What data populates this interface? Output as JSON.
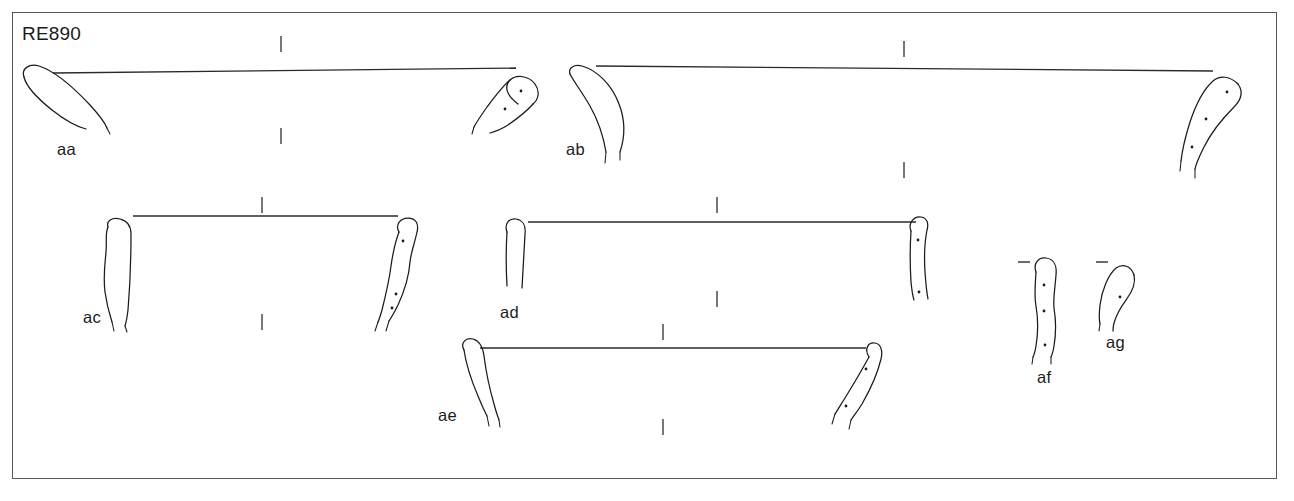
{
  "plate": {
    "title": "RE890",
    "background_color": "#ffffff",
    "frame_color": "#58585a",
    "ink_color": "#1b1b1b",
    "frame": {
      "x": 12,
      "y": 12,
      "width": 1265,
      "height": 467
    }
  },
  "fragments": [
    {
      "id": "aa",
      "label": "aa",
      "label_x": 57,
      "label_y": 140,
      "left_piece": {
        "x": 20,
        "y": 66,
        "dots": 0
      },
      "right_piece": {
        "x": 476,
        "y": 70,
        "dots": 2
      },
      "arc_line": {
        "x1": 53,
        "y1": 73,
        "x2": 516,
        "y2": 68
      },
      "ticks_above": [
        {
          "x": 281,
          "y": 42
        }
      ],
      "ticks_below": [
        {
          "x": 281,
          "y": 134
        }
      ]
    },
    {
      "id": "ab",
      "label": "ab",
      "label_x": 566,
      "label_y": 140,
      "left_piece": {
        "x": 566,
        "y": 64,
        "dots": 0
      },
      "right_piece": {
        "x": 1176,
        "y": 64,
        "dots": 3
      },
      "arc_line": {
        "x1": 596,
        "y1": 66,
        "x2": 1213,
        "y2": 71
      },
      "ticks_above": [
        {
          "x": 904,
          "y": 47
        }
      ],
      "ticks_below": [
        {
          "x": 904,
          "y": 168
        }
      ]
    },
    {
      "id": "ac",
      "label": "ac",
      "label_x": 83,
      "label_y": 308,
      "left_piece": {
        "x": 104,
        "y": 219,
        "dots": 0
      },
      "right_piece": {
        "x": 382,
        "y": 213,
        "dots": 3
      },
      "arc_line": {
        "x1": 133,
        "y1": 216,
        "x2": 398,
        "y2": 216
      },
      "ticks_above": [
        {
          "x": 262,
          "y": 203
        }
      ],
      "ticks_below": [
        {
          "x": 262,
          "y": 320
        }
      ]
    },
    {
      "id": "ad",
      "label": "ad",
      "label_x": 500,
      "label_y": 313,
      "left_piece": {
        "x": 503,
        "y": 219,
        "dots": 0
      },
      "right_piece": {
        "x": 908,
        "y": 213,
        "dots": 2
      },
      "arc_line": {
        "x1": 528,
        "y1": 222,
        "x2": 916,
        "y2": 222
      },
      "ticks_above": [
        {
          "x": 717,
          "y": 203
        }
      ],
      "ticks_below": [
        {
          "x": 717,
          "y": 297
        }
      ]
    },
    {
      "id": "ae",
      "label": "ae",
      "label_x": 438,
      "label_y": 416,
      "left_piece": {
        "x": 460,
        "y": 339,
        "dots": 0
      },
      "right_piece": {
        "x": 828,
        "y": 339,
        "dots": 2
      },
      "arc_line": {
        "x1": 480,
        "y1": 348,
        "x2": 866,
        "y2": 348
      },
      "ticks_above": [
        {
          "x": 663,
          "y": 330
        }
      ],
      "ticks_below": [
        {
          "x": 663,
          "y": 425
        }
      ]
    },
    {
      "id": "af",
      "label": "af",
      "label_x": 1037,
      "label_y": 378,
      "left_piece": {
        "x": 1029,
        "y": 258,
        "dots": 3
      },
      "right_piece": null,
      "arc_line": {
        "x1": 1018,
        "y1": 262,
        "x2": 1030,
        "y2": 262
      },
      "ticks_above": [],
      "ticks_below": []
    },
    {
      "id": "ag",
      "label": "ag",
      "label_x": 1106,
      "label_y": 349,
      "left_piece": {
        "x": 1095,
        "y": 262,
        "dots": 1
      },
      "right_piece": null,
      "arc_line": {
        "x1": 1096,
        "y1": 262,
        "x2": 1108,
        "y2": 262
      },
      "ticks_above": [],
      "ticks_below": []
    }
  ],
  "legend": {
    "description": "Archaeological illustration plate of curved fragment profiles with reconstruction arcs"
  }
}
